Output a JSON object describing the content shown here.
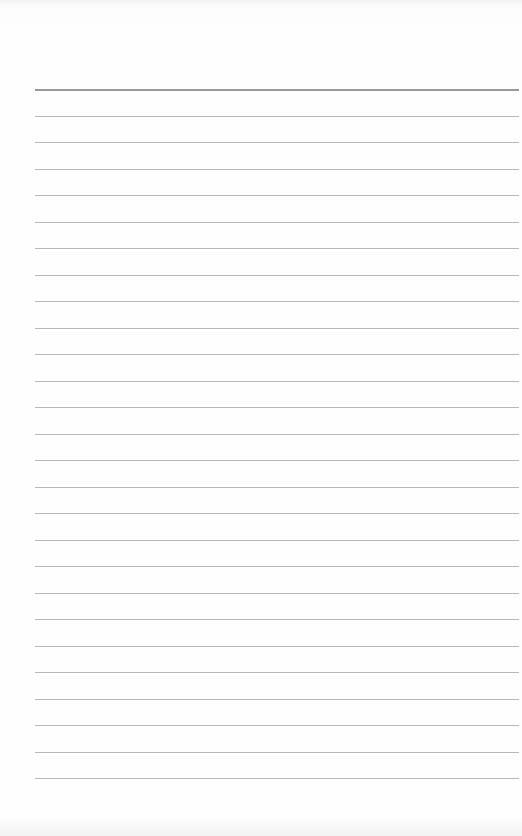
{
  "page": {
    "type": "lined-paper",
    "background_color": "#fefefe",
    "line_color": "#b9b9b9",
    "top_line_color": "#9a9a9a",
    "line_count": 27,
    "first_line_y": 89,
    "line_spacing_px": 26.5,
    "line_left_x": 35,
    "line_right_x": 519
  }
}
